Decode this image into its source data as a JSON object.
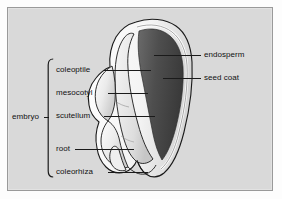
{
  "figure": {
    "background_color": "#d9d9d9",
    "frame_color": "#9a9a9a"
  },
  "diagram": {
    "colors": {
      "endosperm": "#555555",
      "endosperm_dark": "#3f3f3f",
      "seed_coat": "#f2f2f2",
      "embryo": "#e9e9e9",
      "outline": "#1a1a1a",
      "background": "#d9d9d9"
    },
    "structures": [
      {
        "name": "endosperm",
        "side": "right",
        "shade": "dark-gray"
      },
      {
        "name": "seed coat",
        "side": "right",
        "shade": "white-rim"
      },
      {
        "name": "coleoptile",
        "side": "left",
        "group": "embryo"
      },
      {
        "name": "mesocotyl",
        "side": "left",
        "group": "embryo"
      },
      {
        "name": "scutellum",
        "side": "left",
        "group": "embryo"
      },
      {
        "name": "root",
        "side": "left",
        "group": "embryo"
      },
      {
        "name": "coleorhiza",
        "side": "left",
        "group": "embryo"
      }
    ]
  },
  "labels": {
    "left": [
      {
        "text": "coleoptile",
        "x": 48,
        "y": 57,
        "line_from": 96,
        "line_to": 143,
        "line_y": 62
      },
      {
        "text": "mesocotyl",
        "x": 48,
        "y": 80,
        "line_from": 100,
        "line_to": 140,
        "line_y": 85
      },
      {
        "text": "scutellum",
        "x": 48,
        "y": 103,
        "line_from": 96,
        "line_to": 147,
        "line_y": 108
      },
      {
        "text": "root",
        "x": 48,
        "y": 136,
        "line_from": 67,
        "line_to": 126,
        "line_y": 141
      },
      {
        "text": "coleorhiza",
        "x": 48,
        "y": 159,
        "line_from": 100,
        "line_to": 140,
        "line_y": 164
      }
    ],
    "right": [
      {
        "text": "endosperm",
        "x": 196,
        "y": 42,
        "line_from": 146,
        "line_to": 193,
        "line_y": 47
      },
      {
        "text": "seed coat",
        "x": 196,
        "y": 65,
        "line_from": 155,
        "line_to": 193,
        "line_y": 70
      }
    ],
    "group": {
      "text": "embryo",
      "x": 4,
      "y": 104
    }
  }
}
